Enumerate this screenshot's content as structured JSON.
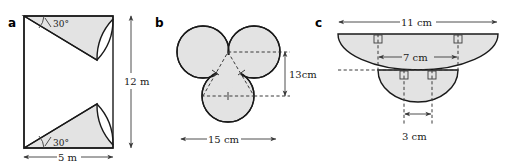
{
  "figure": {
    "kind": "geometry-diagram-set",
    "background_color": "#ffffff",
    "shape_fill_color": "#e3e3e3",
    "outline_color": "#1a1a1a",
    "panels": [
      {
        "label": "a",
        "description": "Rectangle with two 30-degree sector cut-outs",
        "dimensions": [
          {
            "name": "height",
            "value": "12 m"
          },
          {
            "name": "width",
            "value": "5 m"
          }
        ],
        "angles": [
          {
            "name": "top-angle",
            "value": "30°"
          },
          {
            "name": "bottom-angle",
            "value": "30°"
          }
        ]
      },
      {
        "label": "b",
        "description": "Three overlapping circles with inscribed equilateral triangle",
        "dimensions": [
          {
            "name": "height",
            "value": "13cm"
          },
          {
            "name": "width",
            "value": "15 cm"
          }
        ]
      },
      {
        "label": "c",
        "description": "Two nested semicircles with right angle markers",
        "dimensions": [
          {
            "name": "outer-diameter",
            "value": "11 cm"
          },
          {
            "name": "middle-diameter",
            "value": "7 cm"
          },
          {
            "name": "inner-diameter",
            "value": "3 cm"
          }
        ]
      }
    ],
    "labels": {
      "panel_a": "a",
      "panel_b": "b",
      "panel_c": "c",
      "a_height": "12 m",
      "a_width": "5 m",
      "a_angle_top": "30°",
      "a_angle_bottom": "30°",
      "b_height": "13cm",
      "b_width": "15 cm",
      "c_outer": "11 cm",
      "c_middle": "7 cm",
      "c_inner": "3 cm"
    }
  }
}
